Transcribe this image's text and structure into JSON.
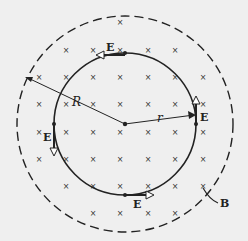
{
  "labels": {
    "E_top": "E",
    "E_right": "E",
    "E_left": "E",
    "E_bottom": "E",
    "R": "R",
    "r": "r",
    "B": "B"
  },
  "field_marker": "×",
  "colors": {
    "background": "#efefef",
    "ink": "#222222"
  },
  "geometry": {
    "center": [
      125,
      124
    ],
    "inner_radius": 71,
    "outer_radius": 108,
    "grid_x": [
      39,
      66,
      93,
      120,
      148,
      175,
      203
    ],
    "grid_y": [
      22,
      50,
      77,
      104,
      132,
      159,
      186,
      213
    ]
  }
}
